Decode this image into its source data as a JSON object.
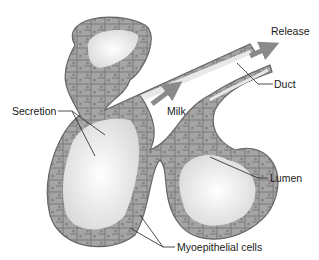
{
  "figure": {
    "labels": {
      "secretion": "Secretion",
      "milk": "Milk",
      "release": "Release",
      "duct": "Duct",
      "lumen": "Lumen",
      "myoepithelial": "Myoepithelial cells"
    },
    "colors": {
      "arrow": "#8a8a8a",
      "cell_fill": "#9a9a9a",
      "cell_dark": "#6e6e6e",
      "lumen": "#f2f2f2",
      "leader_line": "#222222"
    }
  }
}
